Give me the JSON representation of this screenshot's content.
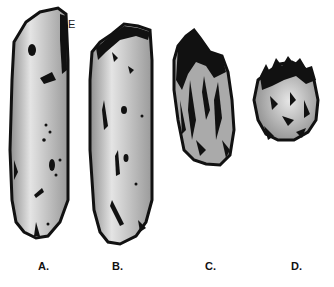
{
  "figure": {
    "panels": [
      {
        "id": "A",
        "label": "A."
      },
      {
        "id": "B",
        "label": "B."
      },
      {
        "id": "C",
        "label": "C."
      },
      {
        "id": "D",
        "label": "D."
      }
    ],
    "annotations": [
      {
        "text": "E",
        "panel": "A"
      }
    ],
    "colors": {
      "fill": "#b8b8b8",
      "highlight": "#e2e2e2",
      "outline": "#111111",
      "background": "#ffffff"
    }
  }
}
